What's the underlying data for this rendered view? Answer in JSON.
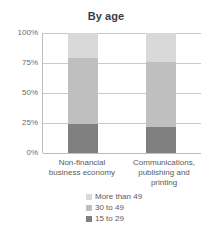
{
  "chart_data": {
    "type": "bar",
    "subtype": "stacked-percentage-column",
    "title": "By age",
    "xlabel": "",
    "ylabel": "",
    "ylim": [
      0,
      100
    ],
    "ytick_labels": [
      "100%",
      "75%",
      "50%",
      "25%",
      "0%"
    ],
    "ytick_values": [
      100,
      75,
      50,
      25,
      0
    ],
    "grid": true,
    "legend_position": "bottom",
    "categories": [
      "Non-financial business economy",
      "Communications, publishing and printing"
    ],
    "category_lines": [
      [
        "Non-financial",
        "business economy"
      ],
      [
        "Communications,",
        "publishing and",
        "printing"
      ]
    ],
    "series": [
      {
        "name": "More than 49",
        "color": "#d9d9d9",
        "values": [
          21,
          24
        ]
      },
      {
        "name": "30 to 49",
        "color": "#bfbfbf",
        "values": [
          55,
          54
        ]
      },
      {
        "name": "15 to 29",
        "color": "#808080",
        "values": [
          24,
          22
        ]
      }
    ],
    "stack_order_bottom_to_top": [
      "15 to 29",
      "30 to 49",
      "More than 49"
    ],
    "units": "percent"
  },
  "legend": {
    "items": [
      {
        "label": "More than 49",
        "color": "#d9d9d9"
      },
      {
        "label": "30 to 49",
        "color": "#bfbfbf"
      },
      {
        "label": "15 to 29",
        "color": "#808080"
      }
    ]
  },
  "colors": {
    "more_than_49": "#d9d9d9",
    "age_30_to_49": "#bfbfbf",
    "age_15_to_29": "#808080",
    "gridline": "#c9c9c9",
    "axis": "#bdbdbd",
    "text": "#5a5a5a",
    "title_text": "#3d3d3d",
    "background": "#ffffff"
  }
}
